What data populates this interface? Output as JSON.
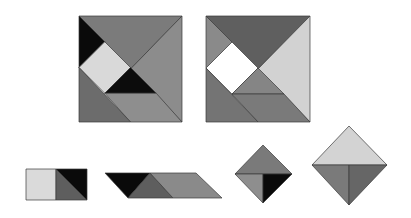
{
  "figures": [
    {
      "name": "square-figure-1",
      "pieces": [
        {
          "name": "large-triangle-top",
          "points": "79,16 182,16 130.5,69",
          "fill": "#7b7b7b"
        },
        {
          "name": "large-triangle-right",
          "points": "182,16 182,122 130.5,69",
          "fill": "#8c8c8c"
        },
        {
          "name": "small-triangle-top-left",
          "points": "79,16 104.75,41.75 79,67.5",
          "fill": "#0a0a0a"
        },
        {
          "name": "square-piece",
          "points": "104.75,41.75 130.5,67.5 104.75,93.25 79,67.5",
          "fill": "#d9d9d9"
        },
        {
          "name": "small-triangle-center",
          "points": "130.5,67.5 156.25,93.25 104.75,93.25",
          "fill": "#0c0c0c"
        },
        {
          "name": "parallelogram-bottom",
          "points": "104.75,93.25 156.25,93.25 182,122 130.5,122",
          "fill": "#8e8e8e"
        },
        {
          "name": "medium-triangle-bottom-left",
          "points": "79,67.5 79,122 130.5,122",
          "fill": "#6c6c6c"
        }
      ]
    },
    {
      "name": "square-figure-2",
      "pieces": [
        {
          "name": "large-triangle-top",
          "points": "206,16 310,16 258,69",
          "fill": "#5f5f5f"
        },
        {
          "name": "large-triangle-right",
          "points": "310,16 310,122 258,69",
          "fill": "#d2d2d2"
        },
        {
          "name": "small-triangle-top-left",
          "points": "206,16 232,42 206,68",
          "fill": "#8a8a8a"
        },
        {
          "name": "square-piece",
          "points": "232,42 258,68 232,94 206,68",
          "fill": "#ffffff"
        },
        {
          "name": "small-triangle-center",
          "points": "258,68 284,94 232,94",
          "fill": "#858585"
        },
        {
          "name": "parallelogram-bottom",
          "points": "232,94 284,94 310,122 258,122",
          "fill": "#7a7a7a"
        },
        {
          "name": "medium-triangle-bottom-left",
          "points": "206,68 206,122 258,122",
          "fill": "#747474"
        }
      ]
    },
    {
      "name": "rectangle-figure",
      "pieces": [
        {
          "name": "square-piece",
          "points": "26,169 56,169 56,200 26,200",
          "fill": "#dadada"
        },
        {
          "name": "small-triangle-dark",
          "points": "56,169 56,200 87,200",
          "fill": "#5e5e5e"
        },
        {
          "name": "small-triangle-black",
          "points": "56,169 87,169 87,200",
          "fill": "#0a0a0a"
        }
      ]
    },
    {
      "name": "parallelogram-figure",
      "pieces": [
        {
          "name": "small-triangle-black",
          "points": "105,173 150,173 128,198",
          "fill": "#0a0a0a"
        },
        {
          "name": "small-triangle-dark",
          "points": "150,173 173,198 128,198",
          "fill": "#5e5e5e"
        },
        {
          "name": "parallelogram-piece",
          "points": "150,173 196,173 222,198 173,198",
          "fill": "#8a8a8a"
        }
      ]
    },
    {
      "name": "small-diamond-figure",
      "pieces": [
        {
          "name": "triangle-top",
          "points": "263,145 292,174 235,174",
          "fill": "#7a7a7a"
        },
        {
          "name": "triangle-bottom-left",
          "points": "235,174 263,174 263,203",
          "fill": "#8e8e8e"
        },
        {
          "name": "triangle-bottom-right",
          "points": "263,174 292,174 263,203",
          "fill": "#0a0a0a"
        }
      ]
    },
    {
      "name": "large-diamond-figure",
      "pieces": [
        {
          "name": "triangle-top",
          "points": "349,126 387,165 312,165",
          "fill": "#d3d3d3"
        },
        {
          "name": "triangle-bottom-left",
          "points": "312,165 349,165 349,205",
          "fill": "#7a7a7a"
        },
        {
          "name": "triangle-bottom-right",
          "points": "349,165 387,165 349,205",
          "fill": "#666666"
        }
      ]
    }
  ]
}
